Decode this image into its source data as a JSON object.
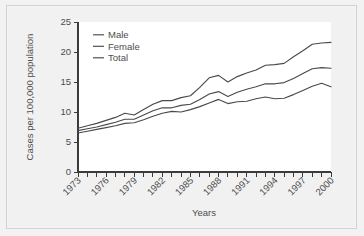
{
  "figure": {
    "background_color": "#f1f1f1",
    "plot_background_color": "#ffffff",
    "line_color": "#4a4a4a",
    "axis_color": "#3b3b3b",
    "text_color": "#4d4d4d"
  },
  "chart_data": {
    "type": "line",
    "title": "",
    "xlabel": "Years",
    "ylabel": "Cases per 100,000 population",
    "xlim": [
      1973,
      2000
    ],
    "ylim": [
      0,
      25
    ],
    "yticks": [
      0,
      5,
      10,
      15,
      20,
      25
    ],
    "ytick_labels": [
      "0",
      "5",
      "10",
      "15",
      "20",
      "25"
    ],
    "xticks": [
      1973,
      1974,
      1975,
      1976,
      1977,
      1978,
      1979,
      1980,
      1981,
      1982,
      1983,
      1984,
      1985,
      1986,
      1987,
      1988,
      1989,
      1990,
      1991,
      1992,
      1993,
      1994,
      1995,
      1996,
      1997,
      1998,
      1999,
      2000
    ],
    "xtick_labels_shown": [
      "1973",
      "1976",
      "1979",
      "1982",
      "1985",
      "1988",
      "1991",
      "1994",
      "1997",
      "2000"
    ],
    "xtick_label_rotation": 45,
    "grid": false,
    "legend_position": "upper-left",
    "x": [
      1973,
      1974,
      1975,
      1976,
      1977,
      1978,
      1979,
      1980,
      1981,
      1982,
      1983,
      1984,
      1985,
      1986,
      1987,
      1988,
      1989,
      1990,
      1991,
      1992,
      1993,
      1994,
      1995,
      1996,
      1997,
      1998,
      1999,
      2000
    ],
    "series": [
      {
        "name": "Male",
        "values": [
          7.3,
          7.7,
          8.1,
          8.6,
          9.1,
          9.8,
          9.5,
          10.4,
          11.3,
          11.9,
          11.9,
          12.4,
          12.7,
          14.1,
          15.7,
          16.1,
          15.0,
          15.9,
          16.5,
          17.0,
          17.8,
          17.9,
          18.1,
          19.2,
          20.2,
          21.3,
          21.5,
          21.6
        ]
      },
      {
        "name": "Female",
        "values": [
          6.9,
          7.2,
          7.5,
          7.9,
          8.3,
          8.8,
          8.8,
          9.5,
          10.2,
          10.7,
          10.7,
          11.1,
          11.3,
          12.1,
          13.0,
          13.4,
          12.6,
          13.3,
          13.8,
          14.2,
          14.7,
          14.7,
          14.9,
          15.6,
          16.4,
          17.2,
          17.4,
          17.3
        ]
      },
      {
        "name": "Total",
        "values": [
          6.5,
          6.8,
          7.1,
          7.4,
          7.7,
          8.1,
          8.2,
          8.7,
          9.3,
          9.8,
          10.1,
          10.0,
          10.4,
          10.9,
          11.5,
          12.1,
          11.4,
          11.7,
          11.8,
          12.2,
          12.5,
          12.2,
          12.3,
          12.9,
          13.6,
          14.3,
          14.8,
          14.2
        ]
      }
    ],
    "legend": [
      "Male",
      "Female",
      "Total"
    ]
  }
}
